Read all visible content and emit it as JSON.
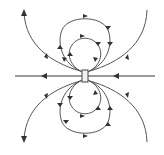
{
  "diagram": {
    "title": "",
    "type": "magnetic-field-lines-dipole",
    "colors": {
      "line": "#555555",
      "axis": "#7a7a7a",
      "arrow": "#333333",
      "magnet_fill": "#f2f2f2",
      "background": "#ffffff"
    },
    "elements": {
      "magnet": "bar-magnet",
      "axis_line": "horizontal field line",
      "inner_loops": 2,
      "middle_loops": 2,
      "outer_open_lines": 4
    },
    "labels": []
  }
}
